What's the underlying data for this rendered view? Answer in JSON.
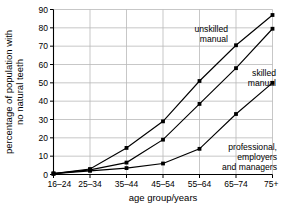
{
  "chart_data": {
    "type": "line",
    "title": "",
    "xlabel": "age group/years",
    "ylabel": "percentage of population with no natural teeth",
    "ylabel_line1": "percentage of population with",
    "ylabel_line2": "no natural teeth",
    "categories": [
      "16–24",
      "25–34",
      "35–44",
      "45–54",
      "55–64",
      "65–74",
      "75+"
    ],
    "yticks": [
      0,
      10,
      20,
      30,
      40,
      50,
      60,
      70,
      80,
      90
    ],
    "ylim": [
      0,
      90
    ],
    "grid": true,
    "legend_position": "inline-annotations",
    "marker": "square",
    "line_color": "#000000",
    "grid_color": "#b9b9b9",
    "axis_color": "#000000",
    "series": [
      {
        "name": "unskilled manual",
        "values": [
          0.5,
          3,
          14.5,
          29,
          51,
          70.5,
          87
        ],
        "annotation_lines": [
          "unskilled",
          "manual"
        ]
      },
      {
        "name": "skilled manual",
        "values": [
          0.5,
          2.5,
          6.5,
          19,
          38.5,
          58,
          79.5
        ],
        "annotation_lines": [
          "skilled",
          "manual"
        ]
      },
      {
        "name": "professional, employers and managers",
        "values": [
          0.5,
          2,
          3.5,
          6,
          14,
          33,
          50
        ],
        "annotation_lines": [
          "professional,",
          "employers",
          "and managers"
        ]
      }
    ]
  }
}
